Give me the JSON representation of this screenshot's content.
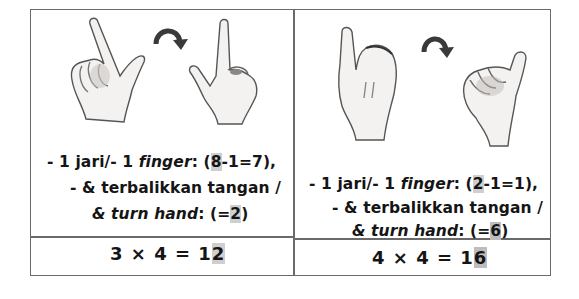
{
  "cells": [
    {
      "id": "left",
      "illustration": {
        "from_hand": "hand-index-finger-thumb-palm-facing",
        "arrow": "curved-arrow-right",
        "to_hand": "hand-index-finger-thumb-back-facing"
      },
      "caption": {
        "line1_prefix": "- 1 jari/- 1 ",
        "line1_italic": "finger",
        "line1_colon": ": (",
        "line1_hl": "8",
        "line1_suffix": "-1=7),",
        "line2": "-  & terbalikkan tangan /",
        "line3_italic": "& turn hand",
        "line3_colon": ": (=",
        "line3_hl": "2",
        "line3_suffix": ")"
      },
      "equation": {
        "prefix": "3 × 4 = 1",
        "hl": "2"
      }
    },
    {
      "id": "right",
      "illustration": {
        "from_hand": "hand-thumb-up-back-facing",
        "arrow": "curved-arrow-right",
        "to_hand": "hand-fist-thumb-palm-facing"
      },
      "caption": {
        "line1_prefix": "- 1 jari/- 1 ",
        "line1_italic": "finger",
        "line1_colon": ": (",
        "line1_hl": "2",
        "line1_suffix": "-1=1),",
        "line2": "-  & terbalikkan tangan /",
        "line3_italic": "& turn hand",
        "line3_colon": ": (=",
        "line3_hl": "6",
        "line3_suffix": ")"
      },
      "equation": {
        "prefix": "4 × 4 = 1",
        "hl": "6"
      }
    }
  ]
}
